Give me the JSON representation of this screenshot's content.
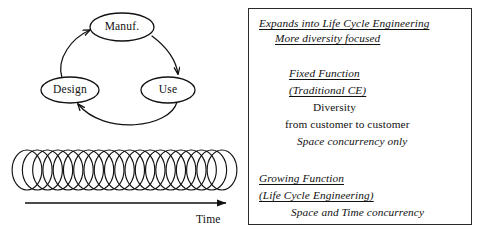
{
  "figure": {
    "background_color": "#ffffff",
    "ink_color": "#111111",
    "panel_border_color": "#2b2b2b"
  },
  "cycle_diagram": {
    "nodes": [
      {
        "id": "manuf",
        "label": "Manuf.",
        "cx": 122,
        "cy": 27,
        "rx": 32,
        "ry": 14
      },
      {
        "id": "design",
        "label": "Design",
        "cx": 70,
        "cy": 90,
        "rx": 29,
        "ry": 13
      },
      {
        "id": "use",
        "label": "Use",
        "cx": 168,
        "cy": 90,
        "rx": 27,
        "ry": 13
      }
    ],
    "edges": [
      {
        "from": "design",
        "to": "manuf"
      },
      {
        "from": "manuf",
        "to": "use"
      },
      {
        "from": "use",
        "to": "design"
      }
    ]
  },
  "time_axis": {
    "label": "Time",
    "label_x": 196,
    "label_y": 213,
    "arrow_y": 203,
    "arrow_x_start": 25,
    "arrow_x_end": 228
  },
  "spring": {
    "coil_count": 20,
    "x_start": 27,
    "x_end": 222,
    "top": 150,
    "bottom": 190
  },
  "text_panel": {
    "lines": [
      {
        "text": "Expands into Life Cycle Engineering",
        "x": 10,
        "y": 8,
        "italic": true,
        "underline": true
      },
      {
        "text": "More diversity focused",
        "x": 26,
        "y": 23,
        "italic": true,
        "underline": true
      },
      {
        "text": "Fixed Function",
        "x": 40,
        "y": 58,
        "italic": true,
        "underline": true
      },
      {
        "text": "(Traditional CE)",
        "x": 40,
        "y": 75,
        "italic": true,
        "underline": true
      },
      {
        "text": "Diversity",
        "x": 64,
        "y": 92,
        "italic": false,
        "underline": false
      },
      {
        "text": "from customer to customer",
        "x": 36,
        "y": 109,
        "italic": false,
        "underline": false
      },
      {
        "text": "Space concurrency only",
        "x": 48,
        "y": 126,
        "italic": true,
        "underline": false
      },
      {
        "text": "Growing Function",
        "x": 10,
        "y": 163,
        "italic": true,
        "underline": true
      },
      {
        "text": "(Life Cycle Engineering)",
        "x": 10,
        "y": 180,
        "italic": true,
        "underline": true
      },
      {
        "text": "Space and Time concurrency",
        "x": 42,
        "y": 197,
        "italic": true,
        "underline": false
      }
    ]
  }
}
